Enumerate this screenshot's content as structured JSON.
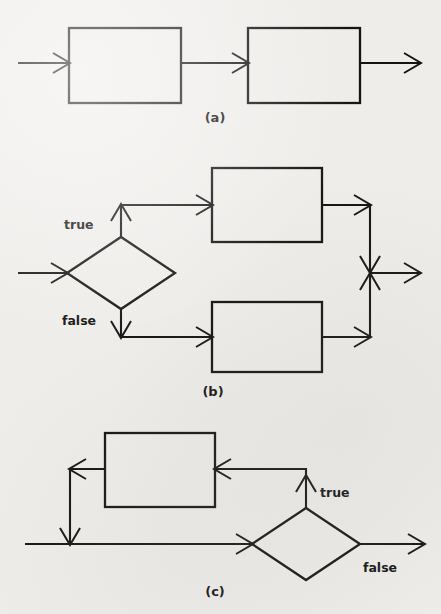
{
  "figure": {
    "background_color": "#efedea",
    "ink_color": "#151515",
    "panels": [
      {
        "id": "a",
        "caption": "(a)",
        "construct": "sequence",
        "caption_x": 215,
        "caption_y": 122,
        "boxes": [
          {
            "name": "process-box-1",
            "x": 69,
            "y": 28,
            "width": 112,
            "height": 75,
            "label": ""
          },
          {
            "name": "process-box-2",
            "x": 248,
            "y": 28,
            "width": 112,
            "height": 75,
            "label": ""
          }
        ],
        "decisions": [],
        "labels": []
      },
      {
        "id": "b",
        "caption": "(b)",
        "construct": "if-then-else",
        "caption_x": 213,
        "caption_y": 396,
        "boxes": [
          {
            "name": "true-branch-box",
            "x": 212,
            "y": 168,
            "width": 110,
            "height": 74,
            "label": ""
          },
          {
            "name": "false-branch-box",
            "x": 212,
            "y": 302,
            "width": 110,
            "height": 70,
            "label": ""
          }
        ],
        "decisions": [
          {
            "name": "condition-diamond",
            "cx": 121,
            "cy": 273,
            "rx": 54,
            "ry": 36
          }
        ],
        "labels": [
          {
            "name": "true-label",
            "text": "true",
            "x": 64,
            "y": 229,
            "anchor": "start"
          },
          {
            "name": "false-label",
            "text": "false",
            "x": 62,
            "y": 325,
            "anchor": "start"
          }
        ]
      },
      {
        "id": "c",
        "caption": "(c)",
        "construct": "loop",
        "caption_x": 215,
        "caption_y": 596,
        "boxes": [
          {
            "name": "loop-body-box",
            "x": 105,
            "y": 433,
            "width": 110,
            "height": 74,
            "label": ""
          }
        ],
        "decisions": [
          {
            "name": "loop-condition-diamond",
            "cx": 306,
            "cy": 544,
            "rx": 54,
            "ry": 36
          }
        ],
        "labels": [
          {
            "name": "true-label",
            "text": "true",
            "x": 320,
            "y": 497,
            "anchor": "start"
          },
          {
            "name": "false-label",
            "text": "false",
            "x": 363,
            "y": 572,
            "anchor": "start"
          }
        ]
      }
    ]
  }
}
